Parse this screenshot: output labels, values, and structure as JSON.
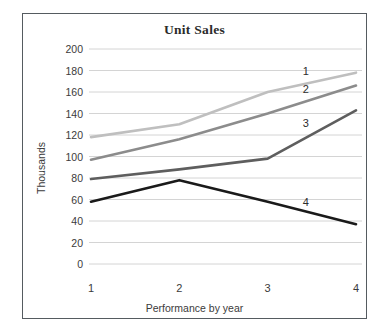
{
  "chart_data": {
    "type": "line",
    "title": "Unit Sales",
    "xlabel": "Performance by year",
    "ylabel": "Thousands",
    "categories": [
      "1",
      "2",
      "3",
      "4"
    ],
    "ylim": [
      0,
      200
    ],
    "ytick_labels": [
      "200",
      "180",
      "160",
      "140",
      "120",
      "100",
      "80",
      "60",
      "40",
      "20",
      "0"
    ],
    "ytick_values": [
      200,
      180,
      160,
      140,
      120,
      100,
      80,
      60,
      40,
      20,
      0
    ],
    "grid": "horizontal",
    "legend": "inline-series-labels",
    "series": [
      {
        "name": "1",
        "label": "1",
        "color": "#bfbfbf",
        "values": [
          118,
          130,
          160,
          178
        ]
      },
      {
        "name": "2",
        "label": "2",
        "color": "#8c8c8c",
        "values": [
          97,
          116,
          140,
          166
        ]
      },
      {
        "name": "3",
        "label": "3",
        "color": "#5e5e5e",
        "values": [
          79,
          88,
          98,
          143
        ]
      },
      {
        "name": "4",
        "label": "4",
        "color": "#1a1a1a",
        "values": [
          58,
          78,
          58,
          37
        ]
      }
    ]
  },
  "frame": {
    "border_color": "#555b60",
    "background": "#ffffff",
    "gridline_color": "#d4d4d4"
  }
}
